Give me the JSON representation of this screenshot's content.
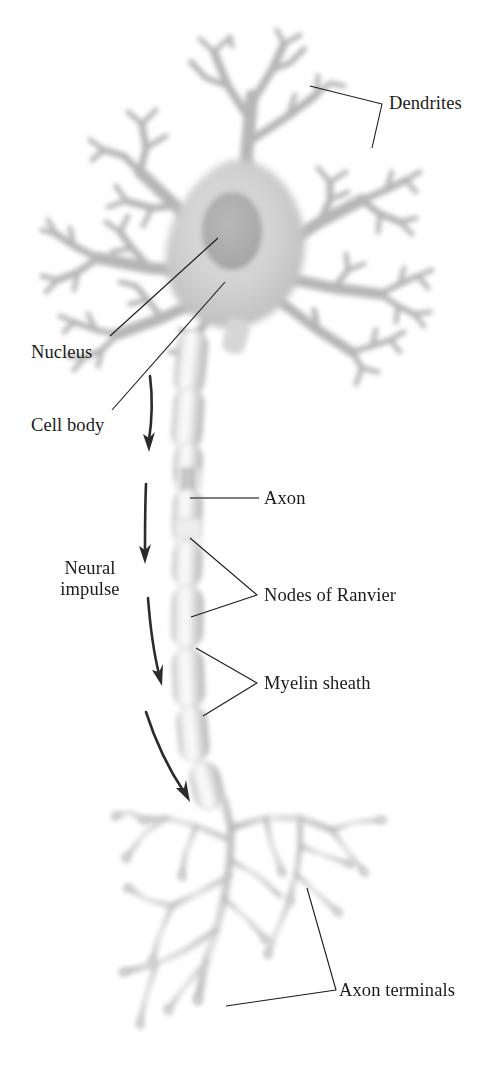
{
  "figure": {
    "background_color": "#ffffff",
    "ink_color": "#1b1b1b",
    "cell_color": "#c9c9c9",
    "nucleus_color": "#aeaeae",
    "myelin_color": "#d8d8d8",
    "terminal_color": "#cfcfcf"
  },
  "labels": {
    "dendrites": "Dendrites",
    "nucleus": "Nucleus",
    "cell_body": "Cell body",
    "axon": "Axon",
    "nodes_of_ranvier": "Nodes of Ranvier",
    "myelin_sheath": "Myelin sheath",
    "neural_impulse": "Neural\nimpulse",
    "axon_terminals": "Axon terminals"
  },
  "parts": [
    {
      "id": "dendrites",
      "name": "Dendrites",
      "leader": "bracket",
      "side": "right"
    },
    {
      "id": "nucleus",
      "name": "Nucleus",
      "leader": "line",
      "side": "left"
    },
    {
      "id": "cell-body",
      "name": "Cell body",
      "leader": "line",
      "side": "left"
    },
    {
      "id": "axon",
      "name": "Axon",
      "leader": "line",
      "side": "right"
    },
    {
      "id": "nodes-of-ranvier",
      "name": "Nodes of Ranvier",
      "leader": "bracket",
      "side": "right"
    },
    {
      "id": "myelin-sheath",
      "name": "Myelin sheath",
      "leader": "bracket",
      "side": "right"
    },
    {
      "id": "axon-terminals",
      "name": "Axon terminals",
      "leader": "bracket",
      "side": "right"
    },
    {
      "id": "neural-impulse",
      "name": "Neural impulse",
      "leader": "arrows",
      "side": "left"
    }
  ],
  "impulse": {
    "direction": "downward",
    "arrow_count": 4,
    "description": "Four curved arrows beside the axon showing signal travel from cell body to axon terminals"
  }
}
